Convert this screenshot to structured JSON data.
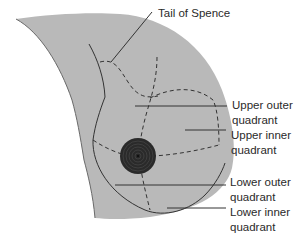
{
  "diagram": {
    "colors": {
      "tissue": "#b9b9b9",
      "outline": "#6a6a6a",
      "line": "#333333",
      "areola": "#2a2a2a",
      "text": "#2a2a2a",
      "background": "#ffffff"
    },
    "labels": {
      "tail": {
        "line1": "Tail of Spence"
      },
      "upper_outer": {
        "line1": "Upper outer",
        "line2": "quadrant"
      },
      "upper_inner": {
        "line1": "Upper inner",
        "line2": "quadrant"
      },
      "lower_outer": {
        "line1": "Lower outer",
        "line2": "quadrant"
      },
      "lower_inner": {
        "line1": "Lower inner",
        "line2": "quadrant"
      }
    }
  }
}
